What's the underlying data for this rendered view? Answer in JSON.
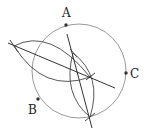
{
  "diagram": {
    "type": "geometric-construction",
    "colors": {
      "circle": "#9a9a9a",
      "construction": "#333333",
      "point": "#333333",
      "label": "#222222"
    },
    "circle": {
      "cx": 79,
      "cy": 71,
      "r": 47
    },
    "points": [
      {
        "id": "A",
        "label": "A",
        "x": 66,
        "y": 25,
        "lx": 62,
        "ly": 17
      },
      {
        "id": "B",
        "label": "B",
        "x": 38,
        "y": 99,
        "lx": 28,
        "ly": 114
      },
      {
        "id": "C",
        "label": "C",
        "x": 126,
        "y": 73,
        "lx": 130,
        "ly": 78
      }
    ],
    "bisector_lines": [
      {
        "name": "bisector-1",
        "x1": 8,
        "y1": 43,
        "x2": 115,
        "y2": 88
      },
      {
        "name": "bisector-2",
        "x1": 67,
        "y1": 34,
        "x2": 92,
        "y2": 128
      }
    ]
  }
}
